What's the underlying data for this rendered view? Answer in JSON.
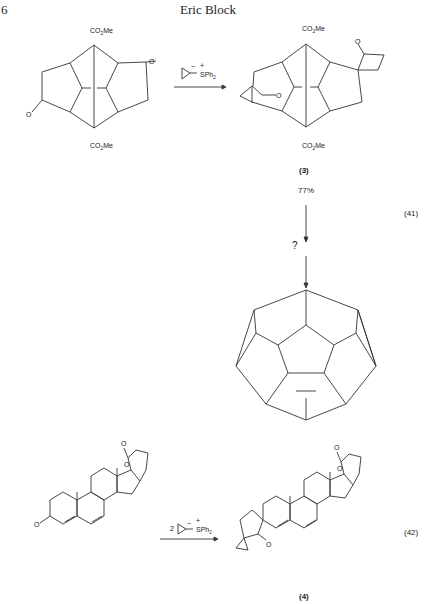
{
  "page": {
    "number": "6",
    "running_header": "Eric Block"
  },
  "scheme41": {
    "reagent_label": "SPh2",
    "reagent_charges": {
      "anion": "−",
      "cation": "+"
    },
    "substituent": "CO2Me",
    "product_label": "(3)",
    "yield": "77%",
    "unknown_step": "?",
    "equation_number": "(41)"
  },
  "scheme42": {
    "reagent_stoich": "2",
    "reagent_label": "SPh2",
    "product_label": "(4)",
    "equation_number": "(42)"
  }
}
